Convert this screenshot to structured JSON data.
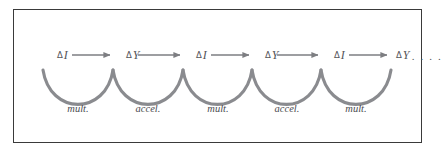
{
  "figure": {
    "type": "process-chain-diagram",
    "border_color": "#3a3a3a",
    "background_color": "#ffffff",
    "arrow_color": "#7d7e82",
    "arc_color": "#8a8b8f",
    "text_color": "#55565a",
    "nodes": [
      {
        "id": "n0",
        "delta": "Δ",
        "symbol": "I",
        "trailing": "",
        "x": 57,
        "y": 55
      },
      {
        "id": "n1",
        "delta": "Δ",
        "symbol": "Y",
        "trailing": "",
        "x": 126,
        "y": 55
      },
      {
        "id": "n2",
        "delta": "Δ",
        "symbol": "I",
        "trailing": "",
        "x": 196,
        "y": 55
      },
      {
        "id": "n3",
        "delta": "Δ",
        "symbol": "Y",
        "trailing": "",
        "x": 265,
        "y": 55
      },
      {
        "id": "n4",
        "delta": "Δ",
        "symbol": "I",
        "trailing": "",
        "x": 334,
        "y": 55
      },
      {
        "id": "n5",
        "delta": "Δ",
        "symbol": "Y",
        "trailing": ". . . .",
        "x": 396,
        "y": 55
      }
    ],
    "arrows": [
      {
        "id": "a0",
        "from": "n0",
        "to": "n1",
        "x1": 72,
        "x2": 110,
        "y": 55
      },
      {
        "id": "a1",
        "from": "n1",
        "to": "n2",
        "x1": 138,
        "x2": 180,
        "y": 55
      },
      {
        "id": "a2",
        "from": "n2",
        "to": "n3",
        "x1": 211,
        "x2": 249,
        "y": 55
      },
      {
        "id": "a3",
        "from": "n3",
        "to": "n4",
        "x1": 277,
        "x2": 318,
        "y": 55
      },
      {
        "id": "a4",
        "from": "n4",
        "to": "n5",
        "x1": 349,
        "x2": 387,
        "y": 55
      }
    ],
    "arcs": [
      {
        "id": "c0",
        "label": "mult.",
        "x1": 43,
        "x2": 113,
        "label_x": 78,
        "label_y": 110
      },
      {
        "id": "c1",
        "label": "accel.",
        "x1": 113,
        "x2": 183,
        "label_x": 148,
        "label_y": 110
      },
      {
        "id": "c2",
        "label": "mult.",
        "x1": 183,
        "x2": 252,
        "label_x": 218,
        "label_y": 110
      },
      {
        "id": "c3",
        "label": "accel.",
        "x1": 252,
        "x2": 321,
        "label_x": 287,
        "label_y": 110
      },
      {
        "id": "c4",
        "label": "mult.",
        "x1": 321,
        "x2": 391,
        "label_x": 356,
        "label_y": 110
      }
    ],
    "arc_geometry": {
      "top_y": 70,
      "bottom_y": 99
    }
  }
}
